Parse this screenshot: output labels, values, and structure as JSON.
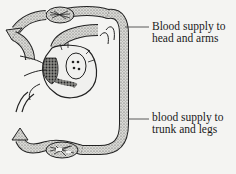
{
  "diagram": {
    "type": "circulation-diagram",
    "labels": {
      "top": {
        "line1": "Blood supply to",
        "line2": "head and arms"
      },
      "bottom": {
        "line1": "blood supply to",
        "line2": "trunk and legs"
      }
    },
    "colors": {
      "background": "#f4f4f2",
      "ink": "#1a1a1a",
      "stipple_fill": "#b8b8b4",
      "dark_fill": "#6a6a66"
    }
  }
}
